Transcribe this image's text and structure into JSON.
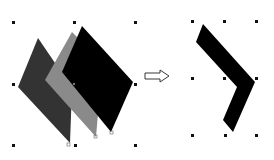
{
  "diagram": {
    "colors": {
      "shape_dark_gray": "#333333",
      "shape_mid_gray": "#8a8a8a",
      "shape_black": "#000000",
      "handle": "#111111",
      "arrow_stroke": "#222222"
    },
    "left_group": {
      "shapes": [
        "dark-gray-parallelogram",
        "mid-gray-parallelogram",
        "black-parallelogram"
      ]
    },
    "arrow": "right-arrow",
    "right_group": {
      "shape": "black-chevron"
    }
  }
}
